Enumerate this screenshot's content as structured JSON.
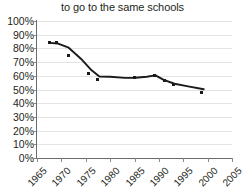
{
  "chart_data": {
    "type": "scatter",
    "title": "to go to the same schools",
    "xlabel": "",
    "ylabel": "",
    "xlim": [
      1965,
      2005
    ],
    "ylim": [
      0,
      100
    ],
    "grid": true,
    "legend": "none",
    "x_ticks": [
      "1965",
      "1970",
      "1975",
      "1980",
      "1985",
      "1990",
      "1995",
      "2000",
      "2005"
    ],
    "x_tick_values": [
      1965,
      1970,
      1975,
      1980,
      1985,
      1990,
      1995,
      2000,
      2005
    ],
    "y_ticks": [
      "0%",
      "10%",
      "20%",
      "30%",
      "40%",
      "50%",
      "60%",
      "70%",
      "80%",
      "90%",
      "100%"
    ],
    "y_tick_values": [
      0,
      10,
      20,
      30,
      40,
      50,
      60,
      70,
      80,
      90,
      100
    ],
    "series": [
      {
        "name": "data points",
        "type": "scatter",
        "color": "#1a1a1a",
        "points": [
          {
            "x": 1967.6,
            "y": 84.0
          },
          {
            "x": 1969.0,
            "y": 84.0
          },
          {
            "x": 1971.4,
            "y": 74.5
          },
          {
            "x": 1975.6,
            "y": 62.0
          },
          {
            "x": 1977.5,
            "y": 57.0
          },
          {
            "x": 1985.0,
            "y": 58.5
          },
          {
            "x": 1989.2,
            "y": 60.5
          },
          {
            "x": 1991.2,
            "y": 56.5
          },
          {
            "x": 1993.0,
            "y": 54.0
          },
          {
            "x": 1998.8,
            "y": 48.0
          }
        ]
      },
      {
        "name": "trend line",
        "type": "line",
        "color": "#1a1a1a",
        "points": [
          {
            "x": 1967.6,
            "y": 84.0
          },
          {
            "x": 1969.2,
            "y": 83.6
          },
          {
            "x": 1971.5,
            "y": 80.5
          },
          {
            "x": 1974.0,
            "y": 72.5
          },
          {
            "x": 1976.2,
            "y": 64.0
          },
          {
            "x": 1977.8,
            "y": 59.5
          },
          {
            "x": 1980.0,
            "y": 59.3
          },
          {
            "x": 1983.0,
            "y": 58.5
          },
          {
            "x": 1985.2,
            "y": 58.6
          },
          {
            "x": 1987.5,
            "y": 59.3
          },
          {
            "x": 1989.3,
            "y": 60.3
          },
          {
            "x": 1991.0,
            "y": 57.0
          },
          {
            "x": 1993.2,
            "y": 54.2
          },
          {
            "x": 1996.0,
            "y": 52.3
          },
          {
            "x": 1999.2,
            "y": 50.2
          }
        ]
      }
    ]
  },
  "colors": {
    "gridline": "#e3e3e3",
    "axis": "#6b6b6b",
    "data": "#1a1a1a",
    "text": "#231f20",
    "background": "#ffffff"
  }
}
